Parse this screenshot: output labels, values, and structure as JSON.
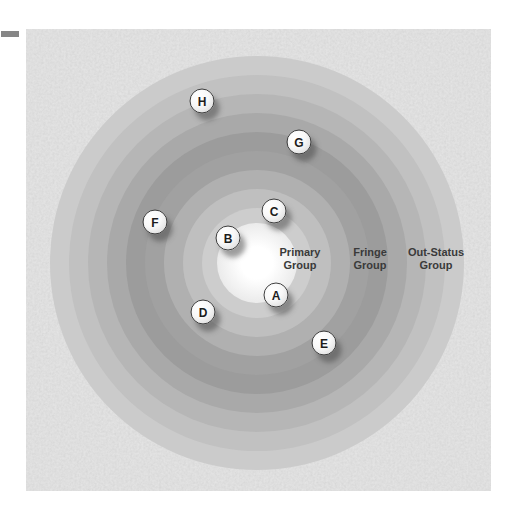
{
  "page": {
    "background_color": "#ffffff",
    "margin_dash_color": "#868686"
  },
  "diagram": {
    "panel_background_color": "#d7d7d7",
    "center": {
      "x": 231,
      "y": 234
    },
    "glow": {
      "radius": 40,
      "inner_color": "#ffffff",
      "outer_color": "#dadada"
    },
    "rings": [
      {
        "radius": 207,
        "color": "#cbcbcb"
      },
      {
        "radius": 188,
        "color": "#c1c1c1"
      },
      {
        "radius": 169,
        "color": "#b6b6b6"
      },
      {
        "radius": 150,
        "color": "#a9a9a9"
      },
      {
        "radius": 131,
        "color": "#9c9c9c"
      },
      {
        "radius": 112,
        "color": "#a1a1a1"
      },
      {
        "radius": 93,
        "color": "#b0b0b0"
      },
      {
        "radius": 74,
        "color": "#bfbfbf"
      },
      {
        "radius": 55,
        "color": "#cdcdcd"
      },
      {
        "radius": 36,
        "color": "#dadada"
      }
    ],
    "zone_labels": [
      {
        "name": "primary-group",
        "lines": [
          "Primary",
          "Group"
        ],
        "x": 274,
        "y": 230
      },
      {
        "name": "fringe-group",
        "lines": [
          "Fringe",
          "Group"
        ],
        "x": 344,
        "y": 230
      },
      {
        "name": "out-status-group",
        "lines": [
          "Out-Status",
          "Group"
        ],
        "x": 410,
        "y": 230
      }
    ],
    "label_color": "#3a3a3a",
    "markers": [
      {
        "letter": "A",
        "x": 250,
        "y": 266
      },
      {
        "letter": "B",
        "x": 202,
        "y": 209
      },
      {
        "letter": "C",
        "x": 248,
        "y": 182
      },
      {
        "letter": "D",
        "x": 177,
        "y": 283
      },
      {
        "letter": "E",
        "x": 298,
        "y": 314
      },
      {
        "letter": "F",
        "x": 129,
        "y": 193
      },
      {
        "letter": "G",
        "x": 273,
        "y": 113
      },
      {
        "letter": "H",
        "x": 176,
        "y": 72
      }
    ],
    "marker_style": {
      "border_color": "#3f3f3f",
      "letter_color": "#1c1c1c",
      "shadow_color": "rgba(70,70,70,0.5)"
    }
  }
}
